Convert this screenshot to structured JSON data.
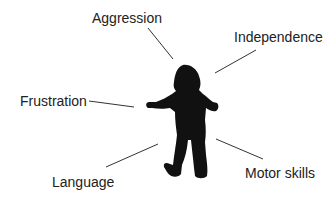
{
  "diagram": {
    "center": "child-silhouette",
    "labels": [
      {
        "id": "aggression",
        "text": "Aggression",
        "x": 92,
        "y": 11
      },
      {
        "id": "independence",
        "text": "Independence",
        "x": 234,
        "y": 30
      },
      {
        "id": "frustration",
        "text": "Frustration",
        "x": 20,
        "y": 94
      },
      {
        "id": "language",
        "text": "Language",
        "x": 52,
        "y": 175
      },
      {
        "id": "motor-skills",
        "text": "Motor skills",
        "x": 245,
        "y": 166
      }
    ],
    "connectors": [
      {
        "to": "aggression",
        "x1": 148,
        "y1": 28,
        "x2": 173,
        "y2": 59
      },
      {
        "to": "independence",
        "x1": 256,
        "y1": 50,
        "x2": 215,
        "y2": 73
      },
      {
        "to": "frustration",
        "x1": 89,
        "y1": 101,
        "x2": 134,
        "y2": 107
      },
      {
        "to": "language",
        "x1": 106,
        "y1": 167,
        "x2": 158,
        "y2": 144
      },
      {
        "to": "motor-skills",
        "x1": 216,
        "y1": 139,
        "x2": 263,
        "y2": 159
      }
    ],
    "colors": {
      "text": "#222222",
      "line": "#333333",
      "silhouette": "#111111"
    }
  }
}
